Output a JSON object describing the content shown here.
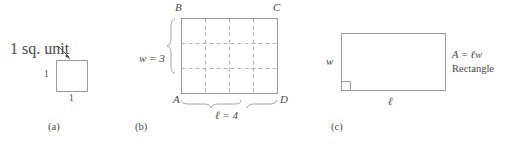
{
  "figure": {
    "colors": {
      "line": "#9a9a9a",
      "dashed": "#a8a8a8",
      "text": "#4a4a4a",
      "background": "#ffffff"
    }
  },
  "panel_a": {
    "tag": "(a)",
    "callout": "1 sq. unit",
    "side_left": "1",
    "side_bottom": "1",
    "square": {
      "x": 56,
      "y": 60,
      "size": 31
    }
  },
  "panel_b": {
    "tag": "(b)",
    "vertex_top_left": "B",
    "vertex_top_right": "C",
    "vertex_bottom_left": "A",
    "vertex_bottom_right": "D",
    "width_label": "w = 3",
    "length_label": "ℓ = 4",
    "grid_columns": 4,
    "grid_rows": 3,
    "rect": {
      "x": 181,
      "y": 18,
      "w": 96,
      "h": 75
    }
  },
  "panel_c": {
    "tag": "(c)",
    "width_label": "w",
    "length_label": "ℓ",
    "formula": "A = ℓw",
    "shape_name": "Rectangle",
    "rect": {
      "x": 341,
      "y": 33,
      "w": 104,
      "h": 57
    },
    "right_angle_marker": true
  }
}
